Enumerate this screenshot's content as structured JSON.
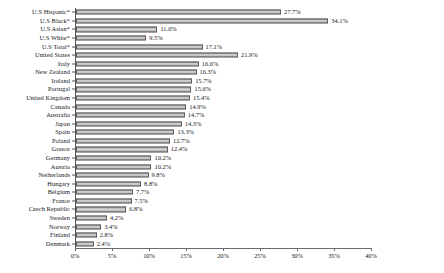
{
  "chart_data": {
    "type": "bar",
    "orientation": "horizontal",
    "title": "",
    "subtitle": "",
    "xlabel": "",
    "ylabel": "",
    "xlim": [
      0,
      40
    ],
    "xtick_labels": [
      "0%",
      "5%",
      "10%",
      "15%",
      "20%",
      "25%",
      "30%",
      "35%",
      "40%"
    ],
    "xtick_values": [
      0,
      5,
      10,
      15,
      20,
      25,
      30,
      35,
      40
    ],
    "grid": false,
    "legend": false,
    "value_suffix": "%",
    "categories": [
      "U.S Hispanic*",
      "U.S Black*",
      "U.S Asian*",
      "U.S White*",
      "U.S Total*",
      "United States",
      "Italy",
      "New Zealand",
      "Ireland",
      "Portugal",
      "United Kingdom",
      "Canada",
      "Australia",
      "Japan",
      "Spain",
      "Poland",
      "Greece",
      "Germany",
      "Austria",
      "Netherlands",
      "Hungary",
      "Belgium",
      "France",
      "Czech Republic",
      "Sweden",
      "Norway",
      "Finland",
      "Denmark"
    ],
    "values": [
      27.7,
      34.1,
      11.0,
      9.5,
      17.1,
      21.9,
      16.6,
      16.3,
      15.7,
      15.6,
      15.4,
      14.9,
      14.7,
      14.3,
      13.3,
      12.7,
      12.4,
      10.2,
      10.2,
      9.8,
      8.8,
      7.7,
      7.5,
      6.8,
      4.2,
      3.4,
      2.8,
      2.4
    ],
    "value_labels": [
      "27.7%",
      "34.1%",
      "11.0%",
      "9.5%",
      "17.1%",
      "21.9%",
      "16.6%",
      "16.3%",
      "15.7%",
      "15.6%",
      "15.4%",
      "14.9%",
      "14.7%",
      "14.3%",
      "13.3%",
      "12.7%",
      "12.4%",
      "10.2%",
      "10.2%",
      "9.8%",
      "8.8%",
      "7.7%",
      "7.5%",
      "6.8%",
      "4.2%",
      "3.4%",
      "2.8%",
      "2.4%"
    ],
    "colors": {
      "bar_fill": "#c9c9c9",
      "bar_edge": "#5d5d5d",
      "axis": "#6a6b6f",
      "text": "#16161a",
      "background": "#ffffff"
    }
  }
}
